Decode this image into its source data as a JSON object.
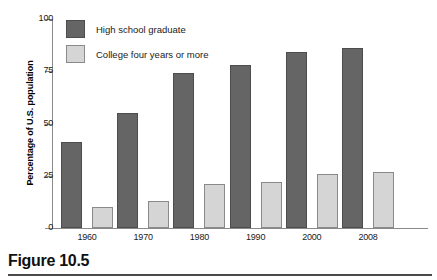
{
  "caption": {
    "label": "Figure 10.5"
  },
  "chart_data": {
    "type": "bar",
    "title": "",
    "subtitle": "",
    "xlabel": "",
    "ylabel": "Percentage of U.S. population",
    "categories": [
      "1960",
      "1970",
      "1980",
      "1990",
      "2000",
      "2008"
    ],
    "series": [
      {
        "name": "High school graduate",
        "color": "#656565",
        "values": [
          41,
          55,
          74,
          78,
          84,
          86
        ]
      },
      {
        "name": "College four years or more",
        "color": "#d5d5d5",
        "values": [
          10,
          13,
          21,
          22,
          26,
          27
        ]
      }
    ],
    "ylim": [
      0,
      100
    ],
    "yticks": [
      0,
      25,
      50,
      75,
      100
    ],
    "ytick_labels": [
      "0",
      "25",
      "50",
      "75",
      "100"
    ],
    "grid": false,
    "legend_position": "top-left",
    "legend": [
      "High school graduate",
      "College four years or more"
    ]
  }
}
